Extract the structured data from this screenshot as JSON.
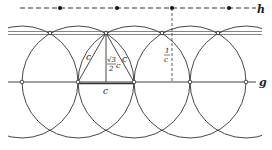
{
  "diagram": {
    "labels": {
      "line_h": "h",
      "line_g": "g",
      "side_left": "c",
      "side_right": "c",
      "base": "c",
      "height_num": "√3",
      "height_den": "2",
      "height_c": "c",
      "spacing_num": "1",
      "spacing_den": "c"
    },
    "colors": {
      "stroke": "#333333",
      "background": "#ffffff"
    },
    "circle_centers_on_g_x": [
      22,
      78,
      134,
      190,
      246
    ],
    "circle_radius": 56,
    "g_y": 82,
    "upper_line_y": 33,
    "h_y": 8,
    "h_dots_x": [
      60,
      117,
      172,
      229
    ],
    "upper_points_x": [
      50,
      106,
      162,
      218
    ]
  }
}
